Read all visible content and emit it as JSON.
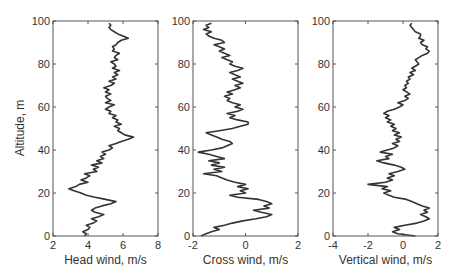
{
  "chart_data": [
    {
      "type": "line",
      "title": "",
      "xlabel": "Head wind, m/s",
      "ylabel": "Altitude, m",
      "xlim": [
        2,
        8
      ],
      "ylim": [
        0,
        100
      ],
      "xticks": [
        2,
        4,
        6,
        8
      ],
      "yticks": [
        0,
        20,
        40,
        60,
        80,
        100
      ],
      "grid": false,
      "series": [
        {
          "name": "Head wind",
          "x": [
            3.8,
            3.9,
            3.7,
            4.0,
            4.1,
            3.9,
            4.3,
            4.5,
            4.2,
            4.6,
            4.9,
            4.4,
            4.2,
            4.4,
            4.8,
            5.3,
            5.6,
            5.0,
            4.4,
            3.9,
            3.6,
            3.2,
            2.9,
            3.3,
            3.5,
            4.0,
            3.6,
            3.9,
            4.1,
            3.8,
            4.5,
            4.3,
            4.6,
            4.2,
            4.8,
            4.5,
            4.9,
            4.7,
            5.0,
            4.8,
            5.2,
            5.4,
            5.2,
            5.6,
            5.9,
            6.3,
            6.6,
            6.1,
            5.9,
            5.7,
            5.8,
            5.5,
            5.9,
            5.6,
            5.7,
            5.4,
            5.6,
            5.2,
            5.3,
            5.0,
            5.2,
            5.5,
            5.0,
            5.3,
            5.1,
            5.0,
            5.3,
            5.0,
            5.2,
            4.9,
            5.3,
            5.5,
            5.2,
            5.6,
            5.4,
            5.7,
            5.5,
            5.8,
            5.4,
            5.6,
            5.5,
            5.3,
            5.7,
            5.5,
            5.6,
            5.8,
            5.4,
            5.5,
            5.4,
            5.6,
            5.7,
            5.9,
            6.3,
            6.0,
            5.7,
            5.5,
            5.3,
            5.2,
            5.3,
            5.2
          ],
          "y": [
            0,
            1,
            2,
            3,
            4,
            5,
            6,
            7,
            8,
            9,
            10,
            11,
            12,
            13,
            14,
            15,
            16,
            17,
            18,
            19,
            20,
            21,
            22,
            23,
            24,
            25,
            26,
            27,
            28,
            29,
            30,
            31,
            32,
            33,
            34,
            35,
            36,
            37,
            38,
            39,
            40,
            41,
            42,
            43,
            44,
            45,
            46,
            47,
            48,
            49,
            50,
            51,
            52,
            53,
            54,
            55,
            56,
            57,
            58,
            59,
            60,
            61,
            62,
            63,
            64,
            65,
            66,
            67,
            68,
            69,
            70,
            71,
            72,
            73,
            74,
            75,
            76,
            77,
            78,
            79,
            80,
            81,
            82,
            83,
            84,
            85,
            86,
            87,
            88,
            89,
            90,
            91,
            92,
            93,
            94,
            95,
            96,
            97,
            98,
            99
          ]
        }
      ]
    },
    {
      "type": "line",
      "title": "",
      "xlabel": "Cross wind, m/s",
      "ylabel": "",
      "xlim": [
        -2,
        2
      ],
      "ylim": [
        0,
        100
      ],
      "xticks": [
        -2,
        0,
        2
      ],
      "yticks": [
        0,
        20,
        40,
        60,
        80,
        100
      ],
      "grid": false,
      "series": [
        {
          "name": "Cross wind",
          "x": [
            -1.7,
            -1.5,
            -1.3,
            -1.0,
            -1.2,
            -0.8,
            -0.5,
            -0.1,
            0.4,
            0.8,
            1.0,
            0.6,
            0.3,
            0.9,
            0.7,
            1.0,
            0.8,
            0.5,
            -0.3,
            -0.6,
            0.0,
            -0.2,
            0.1,
            -0.3,
            0.0,
            -0.4,
            -0.7,
            -0.9,
            -1.1,
            -1.6,
            -0.9,
            -1.2,
            -0.8,
            -1.3,
            -1.0,
            -1.4,
            -0.8,
            -1.1,
            -1.4,
            -1.8,
            -1.3,
            -0.9,
            -0.7,
            -0.5,
            -0.6,
            -0.9,
            -1.1,
            -1.3,
            -1.5,
            -1.0,
            -0.5,
            -0.2,
            0.1,
            0.1,
            -0.3,
            -0.6,
            -0.4,
            -0.7,
            -0.3,
            -0.1,
            -0.4,
            -0.2,
            -0.5,
            -0.7,
            -0.6,
            -0.8,
            -0.5,
            -0.7,
            -0.4,
            -0.2,
            -0.4,
            -0.1,
            -0.3,
            -0.5,
            -0.2,
            -0.4,
            -0.6,
            -0.3,
            -0.1,
            -0.4,
            -0.6,
            -0.5,
            -0.7,
            -0.9,
            -0.6,
            -0.8,
            -1.0,
            -0.8,
            -1.0,
            -1.2,
            -0.8,
            -0.9,
            -1.2,
            -1.4,
            -1.5,
            -1.3,
            -1.6,
            -1.4,
            -1.5,
            -1.3
          ],
          "y": [
            0,
            1,
            2,
            3,
            4,
            5,
            6,
            7,
            8,
            9,
            10,
            11,
            12,
            13,
            14,
            15,
            16,
            17,
            18,
            19,
            20,
            21,
            22,
            23,
            24,
            25,
            26,
            27,
            28,
            29,
            30,
            31,
            32,
            33,
            34,
            35,
            36,
            37,
            38,
            39,
            40,
            41,
            42,
            43,
            44,
            45,
            46,
            47,
            48,
            49,
            50,
            51,
            52,
            53,
            54,
            55,
            56,
            57,
            58,
            59,
            60,
            61,
            62,
            63,
            64,
            65,
            66,
            67,
            68,
            69,
            70,
            71,
            72,
            73,
            74,
            75,
            76,
            77,
            78,
            79,
            80,
            81,
            82,
            83,
            84,
            85,
            86,
            87,
            88,
            89,
            90,
            91,
            92,
            93,
            94,
            95,
            96,
            97,
            98,
            99
          ]
        }
      ]
    },
    {
      "type": "line",
      "title": "",
      "xlabel": "Vertical wind, m/s",
      "ylabel": "",
      "xlim": [
        -4,
        2
      ],
      "ylim": [
        0,
        100
      ],
      "xticks": [
        -4,
        -2,
        0,
        2
      ],
      "yticks": [
        0,
        20,
        40,
        60,
        80,
        100
      ],
      "grid": false,
      "series": [
        {
          "name": "Vertical wind",
          "x": [
            0.7,
            -0.3,
            -0.6,
            -0.2,
            -0.5,
            0.1,
            0.8,
            1.2,
            1.5,
            1.3,
            1.0,
            1.4,
            1.2,
            1.5,
            1.1,
            0.8,
            0.5,
            0.2,
            -0.5,
            -0.8,
            -1.1,
            -0.7,
            -1.2,
            -0.9,
            -2.0,
            -1.0,
            -0.6,
            -0.9,
            -0.5,
            -0.8,
            -0.3,
            0.1,
            -0.1,
            -0.5,
            -1.1,
            -1.5,
            -0.8,
            -1.0,
            -0.6,
            -1.3,
            -0.9,
            -0.5,
            -0.3,
            -0.6,
            -0.2,
            -0.4,
            -0.1,
            -0.5,
            -0.2,
            -0.6,
            -0.4,
            -0.7,
            -0.5,
            -0.9,
            -0.7,
            -1.0,
            -0.8,
            -1.1,
            -0.9,
            -0.5,
            -0.2,
            0.0,
            -0.3,
            0.1,
            0.3,
            0.1,
            0.4,
            0.2,
            0.0,
            0.2,
            0.1,
            0.3,
            0.2,
            0.4,
            0.3,
            0.6,
            0.4,
            0.7,
            0.5,
            0.7,
            0.9,
            0.8,
            0.7,
            0.9,
            1.1,
            1.4,
            1.5,
            1.3,
            1.4,
            1.1,
            1.0,
            1.2,
            0.9,
            1.0,
            1.0,
            0.7,
            0.6,
            0.5,
            0.4,
            0.5
          ],
          "y": [
            0,
            1,
            2,
            3,
            4,
            5,
            6,
            7,
            8,
            9,
            10,
            11,
            12,
            13,
            14,
            15,
            16,
            17,
            18,
            19,
            20,
            21,
            22,
            23,
            24,
            25,
            26,
            27,
            28,
            29,
            30,
            31,
            32,
            33,
            34,
            35,
            36,
            37,
            38,
            39,
            40,
            41,
            42,
            43,
            44,
            45,
            46,
            47,
            48,
            49,
            50,
            51,
            52,
            53,
            54,
            55,
            56,
            57,
            58,
            59,
            60,
            61,
            62,
            63,
            64,
            65,
            66,
            67,
            68,
            69,
            70,
            71,
            72,
            73,
            74,
            75,
            76,
            77,
            78,
            79,
            80,
            81,
            82,
            83,
            84,
            85,
            86,
            87,
            88,
            89,
            90,
            91,
            92,
            93,
            94,
            95,
            96,
            97,
            98,
            99
          ]
        }
      ]
    }
  ],
  "layout": {
    "panels": [
      {
        "left": 53,
        "top": 21,
        "width": 105,
        "height": 215
      },
      {
        "left": 193,
        "top": 21,
        "width": 105,
        "height": 215
      },
      {
        "left": 333,
        "top": 21,
        "width": 105,
        "height": 215
      }
    ],
    "colors": {
      "line": "#333333",
      "frame": "#555555",
      "text": "#333333"
    }
  }
}
